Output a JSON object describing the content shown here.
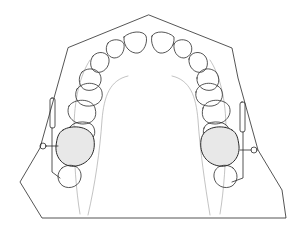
{
  "figure": {
    "colors": {
      "line": "#2a2a2a",
      "faint": "#9a9a9a",
      "background": "#ffffff"
    },
    "cast_outline": [
      [
        149,
        15
      ],
      [
        232,
        48
      ],
      [
        238,
        78
      ],
      [
        258,
        150
      ],
      [
        282,
        190
      ],
      [
        286,
        218
      ],
      [
        42,
        218
      ],
      [
        20,
        182
      ],
      [
        40,
        148
      ],
      [
        68,
        48
      ]
    ],
    "teeth_count_visible": 14,
    "appliances": [
      "left-molar-appliance",
      "right-molar-appliance"
    ]
  }
}
